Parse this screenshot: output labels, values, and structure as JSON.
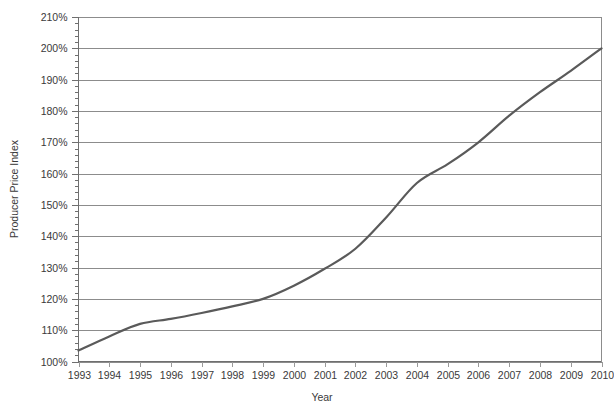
{
  "chart_data": {
    "type": "line",
    "title": "",
    "xlabel": "Year",
    "ylabel": "Producer Price Index",
    "x": [
      1993,
      1994,
      1995,
      1996,
      1997,
      1998,
      1999,
      2000,
      2001,
      2002,
      2003,
      2004,
      2005,
      2006,
      2007,
      2008,
      2009,
      2010
    ],
    "categories": [
      "1993",
      "1994",
      "1995",
      "1996",
      "1997",
      "1998",
      "1999",
      "2000",
      "2001",
      "2002",
      "2003",
      "2004",
      "2005",
      "2006",
      "2007",
      "2008",
      "2009",
      "2010"
    ],
    "series": [
      {
        "name": "Producer Price Index",
        "values": [
          103.5,
          108.0,
          112.0,
          113.6,
          115.5,
          117.6,
          120.0,
          124.2,
          129.6,
          136.0,
          146.0,
          157.0,
          163.0,
          170.0,
          178.5,
          186.0,
          192.8,
          200.0
        ],
        "color": "#5a5a5a"
      }
    ],
    "ylim": [
      100,
      210
    ],
    "xlim": [
      1993,
      2010
    ],
    "ytick_values": [
      100,
      110,
      120,
      130,
      140,
      150,
      160,
      170,
      180,
      190,
      200,
      210
    ],
    "ytick_labels": [
      "100%",
      "110%",
      "120%",
      "130%",
      "140%",
      "150%",
      "160%",
      "170%",
      "180%",
      "190%",
      "200%",
      "210%"
    ],
    "y_minor_step": 2,
    "grid": true,
    "grid_axis": "y",
    "grid_color": "#8c8c8c",
    "legend": false,
    "legend_position": "none",
    "axis_color": "#6f6f6f",
    "background_color": "#ffffff"
  }
}
